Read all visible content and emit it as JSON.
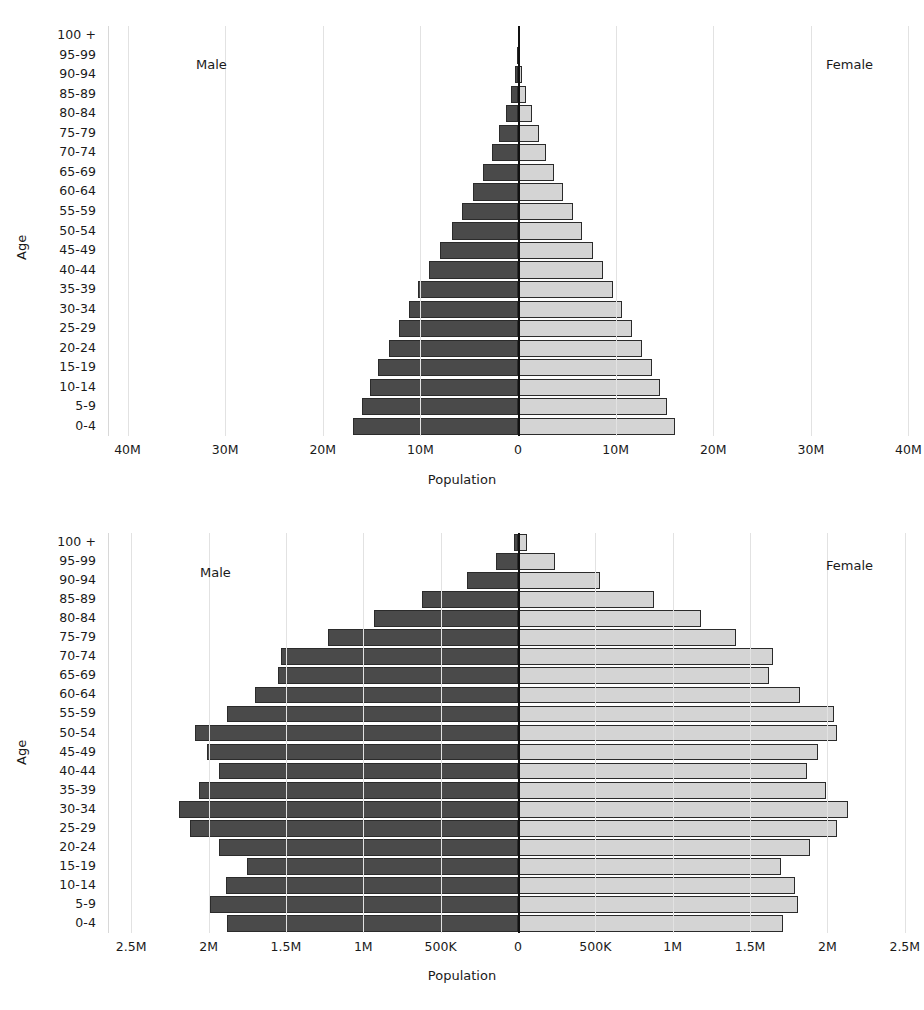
{
  "axis_titles": {
    "x": "Population",
    "y": "Age"
  },
  "series_labels": {
    "male": "Male",
    "female": "Female"
  },
  "age_groups": [
    "100 +",
    "95-99",
    "90-94",
    "85-89",
    "80-84",
    "75-79",
    "70-74",
    "65-69",
    "60-64",
    "55-59",
    "50-54",
    "45-49",
    "40-44",
    "35-39",
    "30-34",
    "25-29",
    "20-24",
    "15-19",
    "10-14",
    "5-9",
    "0-4"
  ],
  "colors": {
    "male": "#4a4a4a",
    "female": "#d4d4d4",
    "outline": "#2b2b2b",
    "grid": "#e2e2e2",
    "axis": "#111111"
  },
  "chart_data": [
    {
      "id": "top-pyramid",
      "type": "bar",
      "orientation": "horizontal",
      "layout": "population-pyramid",
      "title": "",
      "xlabel": "Population",
      "ylabel": "Age",
      "grid": true,
      "legend_position": "inside-top-left-and-top-right",
      "xlim": [
        -42000000,
        42000000
      ],
      "xticks": [
        -40000000,
        -30000000,
        -20000000,
        -10000000,
        0,
        10000000,
        20000000,
        30000000,
        40000000
      ],
      "xticklabels": [
        "40M",
        "30M",
        "20M",
        "10M",
        "0",
        "10M",
        "20M",
        "30M",
        "40M"
      ],
      "categories": [
        "100 +",
        "95-99",
        "90-94",
        "85-89",
        "80-84",
        "75-79",
        "70-74",
        "65-69",
        "60-64",
        "55-59",
        "50-54",
        "45-49",
        "40-44",
        "35-39",
        "30-34",
        "25-29",
        "20-24",
        "15-19",
        "10-14",
        "5-9",
        "0-4"
      ],
      "series": [
        {
          "name": "Male",
          "values": [
            40000,
            130000,
            330000,
            700000,
            1200000,
            1900000,
            2700000,
            3600000,
            4600000,
            5700000,
            6800000,
            8000000,
            9100000,
            10200000,
            11200000,
            12200000,
            13200000,
            14300000,
            15200000,
            16000000,
            16900000
          ]
        },
        {
          "name": "Female",
          "values": [
            60000,
            180000,
            430000,
            850000,
            1400000,
            2100000,
            2900000,
            3700000,
            4600000,
            5600000,
            6600000,
            7700000,
            8700000,
            9700000,
            10700000,
            11700000,
            12700000,
            13700000,
            14500000,
            15300000,
            16100000
          ]
        }
      ],
      "annotations": [
        {
          "text": "Male",
          "position": "left-upper"
        },
        {
          "text": "Female",
          "position": "right-upper"
        }
      ]
    },
    {
      "id": "bottom-pyramid",
      "type": "bar",
      "orientation": "horizontal",
      "layout": "population-pyramid",
      "title": "",
      "xlabel": "Population",
      "ylabel": "Age",
      "grid": true,
      "legend_position": "inside-top-left-and-top-right",
      "xlim": [
        -2650000,
        2650000
      ],
      "xticks": [
        -2500000,
        -2000000,
        -1500000,
        -1000000,
        -500000,
        0,
        500000,
        1000000,
        1500000,
        2000000,
        2500000
      ],
      "xticklabels": [
        "2.5M",
        "2M",
        "1.5M",
        "1M",
        "500K",
        "0",
        "500K",
        "1M",
        "1.5M",
        "2M",
        "2.5M"
      ],
      "categories": [
        "100 +",
        "95-99",
        "90-94",
        "85-89",
        "80-84",
        "75-79",
        "70-74",
        "65-69",
        "60-64",
        "55-59",
        "50-54",
        "45-49",
        "40-44",
        "35-39",
        "30-34",
        "25-29",
        "20-24",
        "15-19",
        "10-14",
        "5-9",
        "0-4"
      ],
      "series": [
        {
          "name": "Male",
          "values": [
            25000,
            140000,
            330000,
            620000,
            930000,
            1230000,
            1530000,
            1550000,
            1700000,
            1880000,
            2090000,
            2010000,
            1930000,
            2060000,
            2190000,
            2120000,
            1930000,
            1750000,
            1890000,
            1990000,
            1880000
          ]
        },
        {
          "name": "Female",
          "values": [
            55000,
            240000,
            530000,
            880000,
            1180000,
            1410000,
            1650000,
            1620000,
            1820000,
            2040000,
            2060000,
            1940000,
            1870000,
            1990000,
            2130000,
            2060000,
            1890000,
            1700000,
            1790000,
            1810000,
            1710000
          ]
        }
      ],
      "annotations": [
        {
          "text": "Male",
          "position": "left-upper"
        },
        {
          "text": "Female",
          "position": "right-upper"
        }
      ]
    }
  ]
}
